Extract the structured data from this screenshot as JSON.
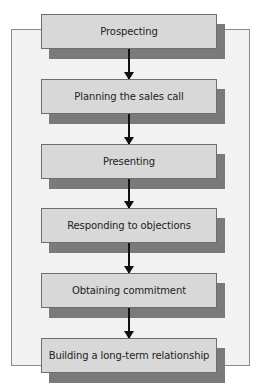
{
  "diagram": {
    "type": "flowchart",
    "steps": [
      {
        "label": "Prospecting"
      },
      {
        "label": "Planning the sales call"
      },
      {
        "label": "Presenting"
      },
      {
        "label": "Responding to objections"
      },
      {
        "label": "Obtaining commitment"
      },
      {
        "label": "Building a long-term relationship"
      }
    ],
    "colors": {
      "box_fill": "#d8d8d8",
      "shadow": "#7a7a7a",
      "frame_fill": "#f2f2f2",
      "arrow": "#111111"
    }
  }
}
